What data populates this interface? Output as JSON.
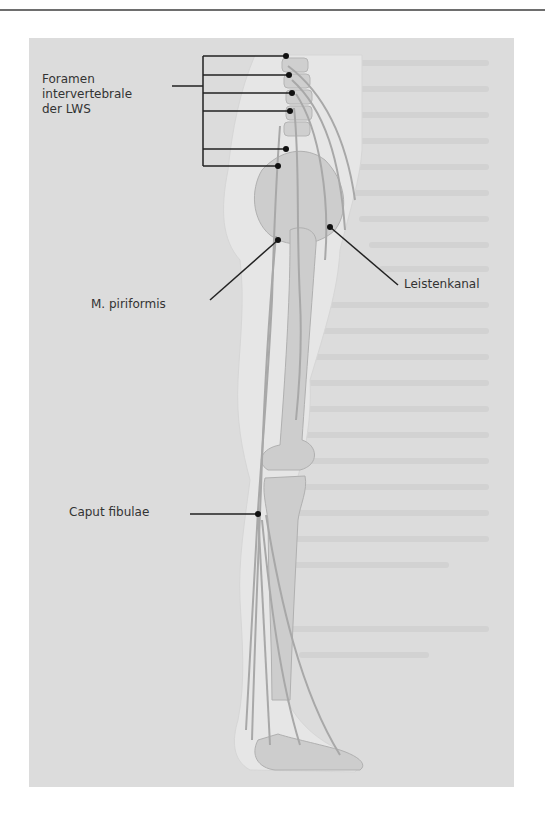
{
  "figure": {
    "labels": {
      "foramen": "Foramen\nintervertebrale\nder LWS",
      "leistenkanal": "Leistenkanal",
      "piriformis": "M. piriformis",
      "caput_fibulae": "Caput fibulae"
    },
    "colors": {
      "panel": "#dcdcdc",
      "bone": "#c9c9c9",
      "body_outline": "#e8e8e8",
      "nerve": "#a8a8a8",
      "leader_line": "#222222",
      "label_text": "#333333"
    }
  }
}
